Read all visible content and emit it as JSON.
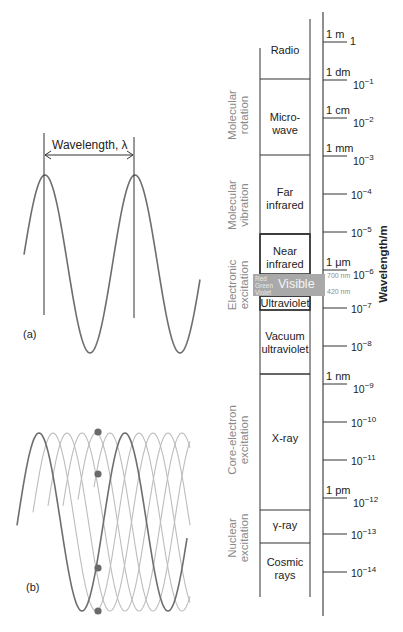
{
  "panel_a": {
    "tag": "(a)",
    "wavelength_label": "Wavelength, λ",
    "wave": {
      "x_start": 24,
      "x_end": 200,
      "peak_x": 45,
      "wavelength_px": 90,
      "y_mid": 264,
      "amplitude": 89
    },
    "markers": [
      {
        "x": 44,
        "y1": 133,
        "y2": 315
      },
      {
        "x": 134,
        "y1": 137,
        "y2": 318
      }
    ],
    "arrow": {
      "x1": 45,
      "x2": 133,
      "y": 155
    }
  },
  "panel_b": {
    "tag": "(b)",
    "main_wave": {
      "x_start": 17,
      "x_end": 187,
      "peak_x": 39,
      "wavelength_px": 86,
      "y_mid": 522,
      "amplitude": 89
    },
    "ghost_offsets_px": [
      14,
      28,
      43,
      57,
      71
    ],
    "ghost_x_start": [
      33,
      48,
      63,
      78,
      94
    ],
    "ghost_x_end": 190,
    "dots": [
      {
        "x": 98,
        "y": 432
      },
      {
        "x": 98,
        "y": 474
      },
      {
        "x": 98,
        "y": 568
      },
      {
        "x": 98,
        "y": 611
      }
    ]
  },
  "spectrum": {
    "axis_title": "Wavelength/m",
    "axis": {
      "x": 323,
      "y_top": 12,
      "y_bottom": 616
    },
    "ticks": [
      {
        "y": 42,
        "unit": "1 m",
        "base": "1",
        "exp": ""
      },
      {
        "y": 80,
        "unit": "1 dm",
        "base": "10",
        "exp": "−1"
      },
      {
        "y": 118,
        "unit": "1 cm",
        "base": "10",
        "exp": "−2"
      },
      {
        "y": 156,
        "unit": "1 mm",
        "base": "10",
        "exp": "−3"
      },
      {
        "y": 194,
        "unit": "",
        "base": "10",
        "exp": "−4"
      },
      {
        "y": 232,
        "unit": "",
        "base": "10",
        "exp": "−5"
      },
      {
        "y": 270,
        "unit": "1 μm",
        "base": "10",
        "exp": "−6"
      },
      {
        "y": 308,
        "unit": "",
        "base": "10",
        "exp": "−7"
      },
      {
        "y": 346,
        "unit": "",
        "base": "10",
        "exp": "−8"
      },
      {
        "y": 384,
        "unit": "1 nm",
        "base": "10",
        "exp": "−9"
      },
      {
        "y": 422,
        "unit": "",
        "base": "10",
        "exp": "−10"
      },
      {
        "y": 460,
        "unit": "",
        "base": "10",
        "exp": "−11"
      },
      {
        "y": 498,
        "unit": "1 pm",
        "base": "10",
        "exp": "−12"
      },
      {
        "y": 534,
        "unit": "",
        "base": "10",
        "exp": "−13"
      },
      {
        "y": 572,
        "unit": "",
        "base": "10",
        "exp": "−14"
      }
    ],
    "column": {
      "x_left": 260,
      "x_right": 310,
      "left_top": 48,
      "right_top": 19,
      "bottom": 597
    },
    "regions": [
      {
        "name": "radio",
        "lines": [
          "Radio"
        ],
        "top": 19,
        "bottom": 79,
        "label_y": 44
      },
      {
        "name": "microwave",
        "lines": [
          "Micro-",
          "wave"
        ],
        "top": 79,
        "bottom": 155,
        "label_y": 111
      },
      {
        "name": "far-ir",
        "lines": [
          "Far",
          "infrared"
        ],
        "top": 155,
        "bottom": 234,
        "label_y": 186
      },
      {
        "name": "near-ir",
        "lines": [
          "Near",
          "infrared"
        ],
        "top": 234,
        "bottom": 274,
        "label_y": 245,
        "bold_border": true
      },
      {
        "name": "ultraviolet",
        "lines": [
          "Ultraviolet"
        ],
        "top": 296,
        "bottom": 310,
        "label_y": 297,
        "bold_border": true
      },
      {
        "name": "vacuum-uv",
        "lines": [
          "Vacuum",
          "ultraviolet"
        ],
        "top": 310,
        "bottom": 374,
        "label_y": 330
      },
      {
        "name": "x-ray",
        "lines": [
          "X-ray"
        ],
        "top": 374,
        "bottom": 510,
        "label_y": 432
      },
      {
        "name": "gamma-ray",
        "lines": [
          "γ-ray"
        ],
        "top": 510,
        "bottom": 543,
        "label_y": 519
      },
      {
        "name": "cosmic-rays",
        "lines": [
          "Cosmic",
          "rays"
        ],
        "top": 543,
        "bottom": 597,
        "label_y": 556
      }
    ],
    "visible": {
      "label": "Visible",
      "colors": [
        "Red",
        "Green",
        "Violet"
      ],
      "top": 274,
      "bottom": 296,
      "x_left": 253,
      "x_right": 325,
      "upper_mark": "700 nm",
      "lower_mark": "420 nm",
      "fill": "#a9a9a9"
    },
    "processes": [
      {
        "lines": [
          "Molecular",
          "rotation"
        ],
        "center_y": 115
      },
      {
        "lines": [
          "Molecular",
          "vibration"
        ],
        "center_y": 205
      },
      {
        "lines": [
          "Electronic",
          "excitation"
        ],
        "center_y": 285
      },
      {
        "lines": [
          "Core-electron",
          "excitation"
        ],
        "center_y": 440
      },
      {
        "lines": [
          "Nuclear",
          "excitation"
        ],
        "center_y": 538
      }
    ]
  },
  "colors": {
    "line": "#333333",
    "wave": "#6e6e6e",
    "ghost_wave": "#bdbdbd",
    "dot": "#6a6a6a",
    "process_text": "#8a8a8a"
  }
}
